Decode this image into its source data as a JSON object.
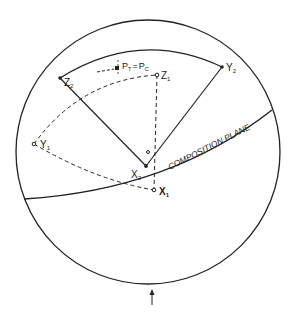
{
  "diagram": {
    "type": "stereographic-projection",
    "colors": {
      "ink": "#222222",
      "background": "#ffffff"
    },
    "primitive_circle": {
      "cx": 148,
      "cy": 152,
      "r": 132
    },
    "center_point": {
      "x": 148,
      "y": 152,
      "label": "o"
    },
    "labels": {
      "z1": "Z",
      "z1_sub": "1",
      "z2": "Z",
      "z2_sub": "2",
      "y1": "Y",
      "y1_sub": "1",
      "y2": "Y",
      "y2_sub": "2",
      "x1": "X",
      "x1_sub": "1",
      "x2": "X",
      "x2_sub": "2",
      "pt": "P",
      "pt_sub": "T",
      "equals": "=",
      "pc": "P",
      "pc_sub": "C",
      "composition_plane": "COMPOSITION PLANE"
    },
    "points": {
      "Z1": {
        "x": 157,
        "y": 75,
        "style": "open"
      },
      "Z2": {
        "x": 60,
        "y": 78,
        "style": "filled"
      },
      "Y1": {
        "x": 34,
        "y": 144,
        "style": "open"
      },
      "Y2": {
        "x": 222,
        "y": 67,
        "style": "filled"
      },
      "X1": {
        "x": 154,
        "y": 190,
        "style": "open"
      },
      "X2": {
        "x": 146,
        "y": 166,
        "style": "filled"
      },
      "P": {
        "x": 117,
        "y": 68,
        "style": "filled-square"
      }
    },
    "arrow": {
      "x": 152,
      "y_from": 305,
      "y_to": 290,
      "direction": "up"
    }
  }
}
